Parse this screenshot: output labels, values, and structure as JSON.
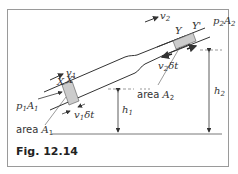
{
  "figure": {
    "caption": "Fig. 12.14",
    "labels": {
      "v1": "v",
      "v1_sub": "1",
      "v2": "v",
      "v2_sub": "2",
      "X": "X",
      "X_prime": "X'",
      "Y": "Y",
      "Y_prime": "Y'",
      "p1A1": "p",
      "p1A1_sub1": "1",
      "p1A1_A": "A",
      "p1A1_sub2": "1",
      "p2A2": "p",
      "p2A2_sub1": "2",
      "p2A2_A": "A",
      "p2A2_sub2": "2",
      "area_A1_prefix": "area ",
      "area_A1": "A",
      "area_A1_sub": "1",
      "area_A2_prefix": "area ",
      "area_A2": "A",
      "area_A2_sub": "2",
      "v1dt": "v",
      "v1dt_sub": "1",
      "v1dt_suffix": "δt",
      "v2dt": "v",
      "v2dt_sub": "2",
      "v2dt_suffix": "δt",
      "h1": "h",
      "h1_sub": "1",
      "h2": "h",
      "h2_sub": "2"
    },
    "colors": {
      "line": "#333333",
      "fluid_element": "#cccccc",
      "frame": "#9a9a9a"
    }
  }
}
